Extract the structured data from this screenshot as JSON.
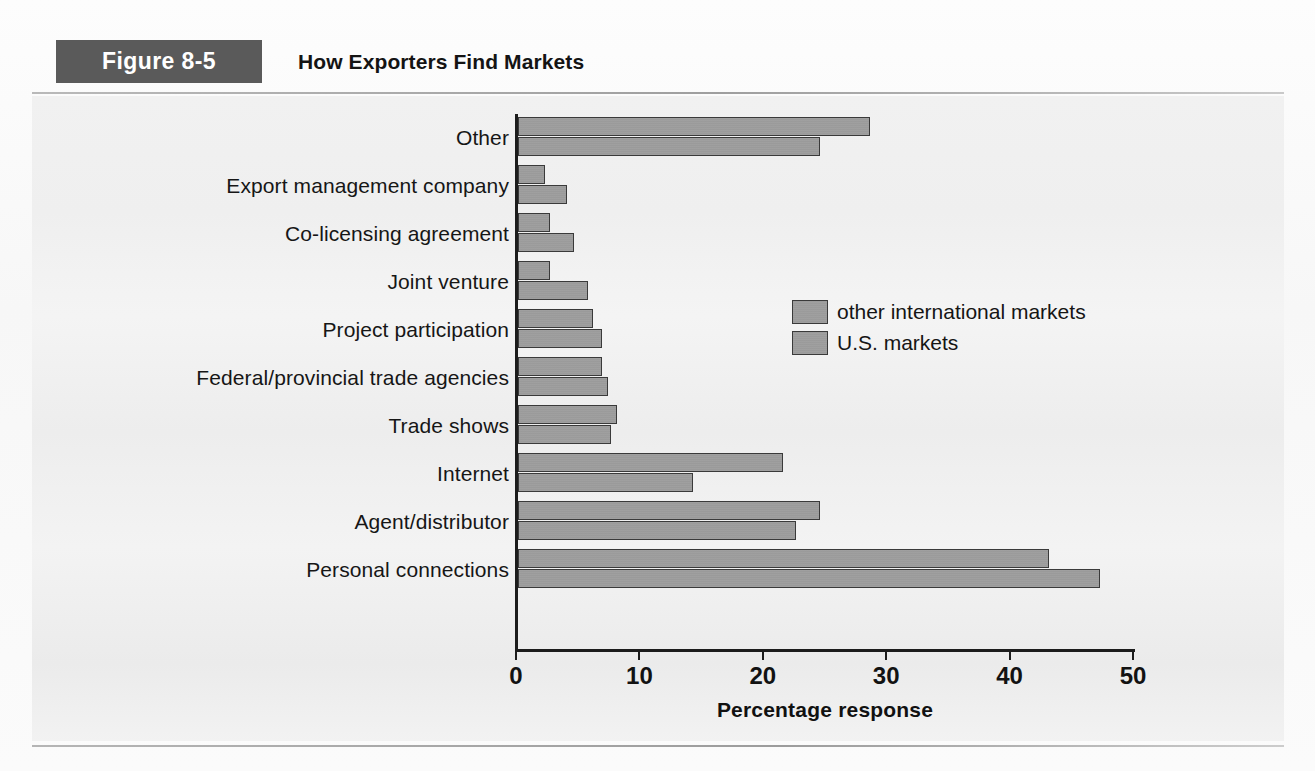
{
  "figure": {
    "number_label": "Figure 8-5",
    "title": "How Exporters Find Markets"
  },
  "colors": {
    "figure_number_background": "#5a5a5a",
    "figure_number_text": "#ffffff",
    "bar_fill": "#9d9d9d",
    "bar_stroke": "#3a3a3a",
    "plot_background": "#efefef",
    "axis": "#1c1c1c",
    "text": "#151515"
  },
  "chart_data": {
    "type": "bar",
    "orientation": "horizontal",
    "title": "How Exporters Find Markets",
    "xlabel": "Percentage response",
    "ylabel": "",
    "xlim": [
      0,
      50
    ],
    "xticks": [
      0,
      10,
      20,
      30,
      40,
      50
    ],
    "xtick_labels": [
      "0",
      "10",
      "20",
      "30",
      "40",
      "50"
    ],
    "grid": false,
    "legend_position": "upper right inside",
    "categories": [
      "Other",
      "Export management company",
      "Co-licensing agreement",
      "Joint venture",
      "Project participation",
      "Federal/provincial trade agencies",
      "Trade shows",
      "Internet",
      "Agent/distributor",
      "Personal connections"
    ],
    "series": [
      {
        "name": "other international markets",
        "values": [
          28.5,
          2.2,
          2.6,
          2.6,
          6.1,
          6.8,
          8.0,
          21.5,
          24.5,
          43.0
        ]
      },
      {
        "name": "U.S. markets",
        "values": [
          24.5,
          4.0,
          4.5,
          5.7,
          6.8,
          7.3,
          7.5,
          14.2,
          22.5,
          47.2
        ]
      }
    ]
  }
}
